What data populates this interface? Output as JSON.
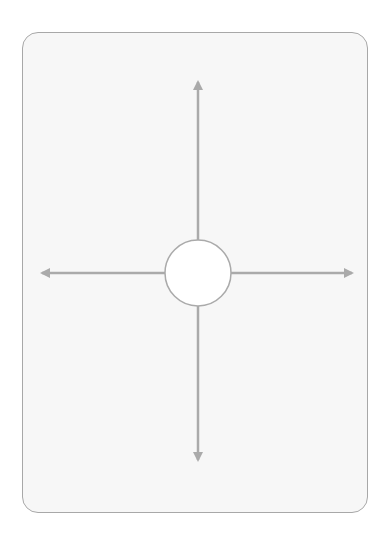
{
  "diagram": {
    "type": "four-direction-arrows",
    "card": {
      "background": "#f7f7f7",
      "border_color": "#a8a8a8"
    },
    "center": {
      "shape": "circle",
      "cx": 198,
      "cy": 273,
      "r": 33,
      "fill": "#ffffff",
      "stroke": "#aaaaaa"
    },
    "arrow_color": "#aaaaaa",
    "arrows": [
      {
        "direction": "up",
        "from": [
          198,
          240
        ],
        "to": [
          198,
          80
        ]
      },
      {
        "direction": "down",
        "from": [
          198,
          306
        ],
        "to": [
          198,
          462
        ]
      },
      {
        "direction": "left",
        "from": [
          165,
          273
        ],
        "to": [
          40,
          273
        ]
      },
      {
        "direction": "right",
        "from": [
          231,
          273
        ],
        "to": [
          354,
          273
        ]
      }
    ]
  }
}
